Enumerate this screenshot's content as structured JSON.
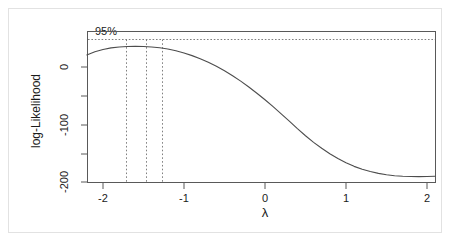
{
  "figure": {
    "kind": "boxcox-log-likelihood-plot",
    "background": "#ffffff",
    "frame_color": "#595959",
    "curve_color": "#4d4d4d",
    "dotted_color": "#808080",
    "border_color": "#e2e2e2"
  },
  "chart_data": {
    "type": "line",
    "title": "",
    "subtitle": "",
    "xlabel": "λ",
    "ylabel": "log-Likelihood",
    "xlim": [
      -2.2,
      2.15
    ],
    "ylim": [
      -205,
      55
    ],
    "grid": false,
    "legend": null,
    "xticks": [
      -2,
      -1,
      0,
      1,
      2
    ],
    "xtick_labels": [
      "-2",
      "-1",
      "0",
      "1",
      "2"
    ],
    "yticks": [
      0,
      -100,
      -200
    ],
    "ytick_labels": [
      "0",
      "-100",
      "-200"
    ],
    "yticks_minor": [
      -50,
      -150
    ],
    "series": [
      {
        "name": "log-Likelihood",
        "style": "solid",
        "x": [
          -2.2,
          -2.1,
          -2.0,
          -1.9,
          -1.8,
          -1.7,
          -1.6,
          -1.5,
          -1.4,
          -1.3,
          -1.2,
          -1.1,
          -1.0,
          -0.9,
          -0.8,
          -0.7,
          -0.6,
          -0.5,
          -0.4,
          -0.3,
          -0.2,
          -0.1,
          0.0,
          0.1,
          0.2,
          0.3,
          0.4,
          0.5,
          0.6,
          0.7,
          0.8,
          0.9,
          1.0,
          1.1,
          1.2,
          1.3,
          1.4,
          1.5,
          1.6,
          1.7,
          1.8,
          1.9,
          2.0,
          2.1
        ],
        "y": [
          21.0,
          26.5,
          30.5,
          33.2,
          34.8,
          35.6,
          35.8,
          35.6,
          34.8,
          33.4,
          31.2,
          28.2,
          24.4,
          19.8,
          14.4,
          8.2,
          1.2,
          -6.6,
          -15.2,
          -24.6,
          -34.8,
          -45.6,
          -57.0,
          -69.0,
          -81.4,
          -94.2,
          -107.2,
          -119.6,
          -131.0,
          -141.4,
          -150.8,
          -159.2,
          -166.6,
          -172.8,
          -177.8,
          -181.8,
          -185.0,
          -187.4,
          -189.0,
          -190.0,
          -190.5,
          -190.6,
          -190.4,
          -190.0
        ]
      }
    ],
    "annotations": [
      {
        "name": "confidence-level-label",
        "text": "95%",
        "x": -1.92,
        "y": 50
      },
      {
        "name": "confidence-threshold-line",
        "style": "dotted",
        "orientation": "horizontal",
        "y": 32.0
      },
      {
        "name": "ci-lower-bound-line",
        "style": "dotted",
        "orientation": "vertical",
        "x": -1.72
      },
      {
        "name": "mle-line",
        "style": "dotted",
        "orientation": "vertical",
        "x": -1.47
      },
      {
        "name": "ci-upper-bound-line",
        "style": "dotted",
        "orientation": "vertical",
        "x": -1.27
      }
    ]
  }
}
